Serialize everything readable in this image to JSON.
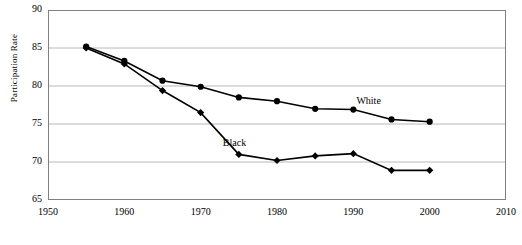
{
  "chart_data": {
    "type": "line",
    "title": "",
    "subtitle": "",
    "xlabel": "",
    "ylabel": "Participation Rate",
    "x": [
      1955,
      1960,
      1965,
      1970,
      1975,
      1980,
      1985,
      1990,
      1995,
      2000
    ],
    "xlim": [
      1950,
      2010
    ],
    "ylim": [
      65,
      90
    ],
    "xticks": [
      "1950",
      "1960",
      "1970",
      "1980",
      "1990",
      "2000",
      "2010"
    ],
    "xtick_values": [
      1950,
      1960,
      1970,
      1980,
      1990,
      2000,
      2010
    ],
    "yticks": [
      "65",
      "70",
      "75",
      "80",
      "85",
      "90"
    ],
    "ytick_values": [
      65,
      70,
      75,
      80,
      85,
      90
    ],
    "grid": "horizontal",
    "legend": "inline-annotations",
    "series": [
      {
        "name": "White",
        "marker": "circle",
        "color": "#000000",
        "values": [
          85.2,
          83.3,
          80.7,
          79.9,
          78.5,
          78.0,
          77.0,
          76.9,
          75.6,
          75.3
        ]
      },
      {
        "name": "Black",
        "marker": "diamond",
        "color": "#000000",
        "values": [
          85.0,
          82.9,
          79.4,
          76.5,
          71.0,
          70.2,
          70.8,
          71.1,
          68.9,
          68.9
        ]
      }
    ],
    "annotations": [
      {
        "text": "White",
        "x": 1992.5,
        "y": 77.9
      },
      {
        "text": "Black",
        "x": 1975.0,
        "y": 72.4
      }
    ]
  },
  "axes": {
    "frame_color": "#808080",
    "grid_color": "#a6a6a6",
    "line_color": "#000000"
  }
}
